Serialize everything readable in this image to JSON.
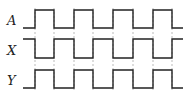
{
  "diagram": {
    "type": "timing-diagram",
    "signals": [
      {
        "name": "A",
        "label_y": 20,
        "high_y": 10,
        "low_y": 28,
        "initial": "low"
      },
      {
        "name": "X",
        "label_y": 50,
        "high_y": 39,
        "low_y": 58,
        "initial": "high"
      },
      {
        "name": "Y",
        "label_y": 80,
        "high_y": 70,
        "low_y": 88,
        "initial": "low"
      }
    ],
    "start_x": 23,
    "end_x": 183,
    "transitions_x": [
      35,
      54,
      74,
      93,
      113,
      133,
      153,
      172
    ],
    "colors": {
      "line": "#222222",
      "dash": "#aaaaaa"
    }
  }
}
